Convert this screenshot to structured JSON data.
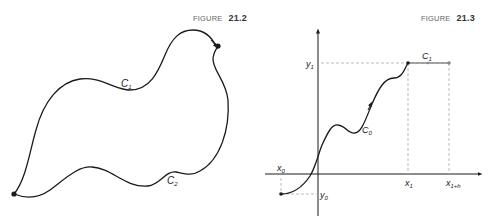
{
  "figures": [
    {
      "caption_word": "FIGURE",
      "caption_number": "21.2",
      "curves": [
        {
          "name": "C",
          "subscript": "1",
          "description": "upper curve from lower-left point to upper-right point"
        },
        {
          "name": "C",
          "subscript": "2",
          "description": "lower curve from lower-left point to upper-right point"
        }
      ]
    },
    {
      "caption_word": "FIGURE",
      "caption_number": "21.3",
      "curves": [
        {
          "name": "C",
          "subscript": "0",
          "description": "wavy curve from (x0,y0) to (x1,y1)"
        },
        {
          "name": "C",
          "subscript": "1",
          "description": "horizontal segment from (x1,y1) to (x1+h,y1)"
        }
      ],
      "axis_labels": {
        "x0": {
          "base": "x",
          "sub": "0"
        },
        "x1": {
          "base": "x",
          "sub": "1"
        },
        "x1h": {
          "base": "x",
          "sub": "1+h"
        },
        "y0": {
          "base": "y",
          "sub": "0"
        },
        "y1": {
          "base": "y",
          "sub": "1"
        }
      }
    }
  ],
  "colors": {
    "ink": "#1a1a1a",
    "grey_segment": "#888888",
    "dashed": "#aaaaaa",
    "caption": "#666666"
  }
}
